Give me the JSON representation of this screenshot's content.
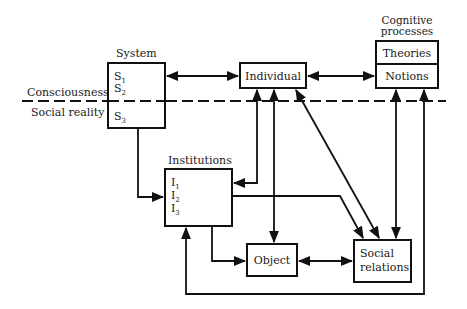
{
  "diagram": {
    "divider": {
      "above_label": "Consciousness",
      "below_label": "Social reality"
    },
    "nodes": {
      "system": {
        "title": "System",
        "items": [
          {
            "base": "S",
            "sub": "1"
          },
          {
            "base": "S",
            "sub": "2"
          },
          {
            "base": "S",
            "sub": "3"
          }
        ]
      },
      "individual": {
        "label": "Individual"
      },
      "cognitive": {
        "title_line1": "Cognitive",
        "title_line2": "processes",
        "rows": [
          "Theories",
          "Notions"
        ]
      },
      "institutions": {
        "title": "Institutions",
        "items": [
          {
            "base": "I",
            "sub": "1"
          },
          {
            "base": "I",
            "sub": "2"
          },
          {
            "base": "I",
            "sub": "3"
          }
        ]
      },
      "object": {
        "label": "Object"
      },
      "social_relations": {
        "line1": "Social",
        "line2": "relations"
      }
    },
    "edges": [
      {
        "from": "System",
        "to": "Individual",
        "type": "bidirectional"
      },
      {
        "from": "Individual",
        "to": "Cognitive processes (Notions)",
        "type": "bidirectional"
      },
      {
        "from": "System (S3)",
        "to": "Institutions",
        "type": "directed"
      },
      {
        "from": "Individual",
        "to": "Institutions",
        "type": "bidirectional"
      },
      {
        "from": "Individual",
        "to": "Object",
        "type": "bidirectional"
      },
      {
        "from": "Individual",
        "to": "Social relations",
        "type": "bidirectional"
      },
      {
        "from": "Institutions",
        "to": "Social relations",
        "type": "directed"
      },
      {
        "from": "Institutions",
        "to": "Object",
        "type": "directed"
      },
      {
        "from": "Object",
        "to": "Social relations",
        "type": "bidirectional"
      },
      {
        "from": "Cognitive processes",
        "to": "Social relations",
        "type": "bidirectional"
      },
      {
        "from": "Social relations loop",
        "to": "Institutions / Cognitive processes",
        "type": "directed"
      }
    ]
  }
}
